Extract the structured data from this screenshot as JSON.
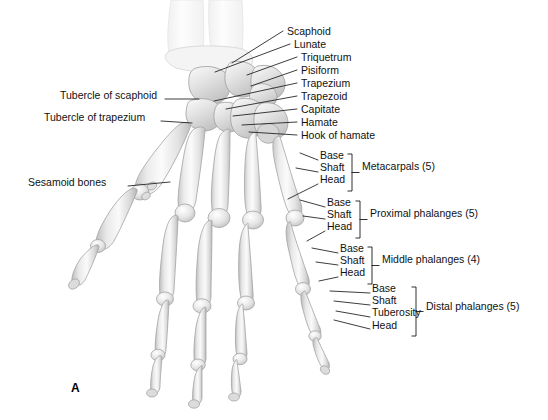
{
  "figure": {
    "panel_label": "A"
  },
  "carpal_labels": [
    {
      "text": "Scaphoid",
      "x": 287,
      "y": 31,
      "tip_x": 232,
      "tip_y": 63
    },
    {
      "text": "Lunate",
      "x": 294,
      "y": 44,
      "tip_x": 215,
      "tip_y": 72
    },
    {
      "text": "Triquetrum",
      "x": 301,
      "y": 57,
      "tip_x": 247,
      "tip_y": 75
    },
    {
      "text": "Pisiform",
      "x": 301,
      "y": 70,
      "tip_x": 251,
      "tip_y": 86
    },
    {
      "text": "Trapezium",
      "x": 301,
      "y": 83,
      "tip_x": 214,
      "tip_y": 101
    },
    {
      "text": "Trapezoid",
      "x": 301,
      "y": 96,
      "tip_x": 226,
      "tip_y": 109
    },
    {
      "text": "Capitate",
      "x": 301,
      "y": 109,
      "tip_x": 233,
      "tip_y": 116
    },
    {
      "text": "Hamate",
      "x": 301,
      "y": 122,
      "tip_x": 242,
      "tip_y": 125
    },
    {
      "text": "Hook of hamate",
      "x": 301,
      "y": 135,
      "tip_x": 249,
      "tip_y": 132
    }
  ],
  "left_labels": [
    {
      "text": "Tubercle of scaphoid",
      "x": 60,
      "y": 95,
      "line_x1": 165,
      "line_y1": 99,
      "line_x2": 199,
      "line_y2": 99
    },
    {
      "text": "Tubercle of trapezium",
      "x": 44,
      "y": 117,
      "line_x1": 161,
      "line_y1": 121,
      "line_x2": 192,
      "line_y2": 123
    },
    {
      "text": "Sesamoid bones",
      "x": 28,
      "y": 182,
      "line_x1": 128,
      "line_y1": 186,
      "line_x2": 170,
      "line_y2": 182
    }
  ],
  "groups": [
    {
      "name": "Metacarpals (5)",
      "parts": [
        "Base",
        "Shaft",
        "Head"
      ],
      "stack_x": 320,
      "stack_y": 155,
      "bracket_x": 352,
      "bracket_top": 154,
      "bracket_bottom": 191,
      "label_x": 362,
      "label_y": 167,
      "leaders": [
        {
          "x1": 318,
          "y1": 160,
          "x2": 300,
          "y2": 153
        },
        {
          "x1": 318,
          "y1": 172,
          "x2": 296,
          "y2": 168
        },
        {
          "x1": 318,
          "y1": 184,
          "x2": 288,
          "y2": 199
        }
      ]
    },
    {
      "name": "Proximal phalanges (5)",
      "parts": [
        "Base",
        "Shaft",
        "Head"
      ],
      "stack_x": 327,
      "stack_y": 202,
      "bracket_x": 360,
      "bracket_top": 201,
      "bracket_bottom": 238,
      "label_x": 370,
      "label_y": 214,
      "leaders": [
        {
          "x1": 325,
          "y1": 207,
          "x2": 300,
          "y2": 200
        },
        {
          "x1": 325,
          "y1": 219,
          "x2": 303,
          "y2": 216
        },
        {
          "x1": 325,
          "y1": 231,
          "x2": 307,
          "y2": 241
        }
      ]
    },
    {
      "name": "Middle phalanges (4)",
      "parts": [
        "Base",
        "Shaft",
        "Head"
      ],
      "stack_x": 340,
      "stack_y": 248,
      "bracket_x": 372,
      "bracket_top": 247,
      "bracket_bottom": 284,
      "label_x": 382,
      "label_y": 260,
      "leaders": [
        {
          "x1": 338,
          "y1": 253,
          "x2": 312,
          "y2": 248
        },
        {
          "x1": 338,
          "y1": 265,
          "x2": 316,
          "y2": 262
        },
        {
          "x1": 338,
          "y1": 277,
          "x2": 319,
          "y2": 281
        }
      ]
    },
    {
      "name": "Distal phalanges (5)",
      "parts": [
        "Base",
        "Shaft",
        "Tuberosity",
        "Head"
      ],
      "stack_x": 372,
      "stack_y": 288,
      "bracket_x": 416,
      "bracket_top": 287,
      "bracket_bottom": 336,
      "label_x": 426,
      "label_y": 307,
      "leaders": [
        {
          "x1": 370,
          "y1": 293,
          "x2": 330,
          "y2": 291
        },
        {
          "x1": 370,
          "y1": 305,
          "x2": 334,
          "y2": 301
        },
        {
          "x1": 370,
          "y1": 317,
          "x2": 336,
          "y2": 311
        },
        {
          "x1": 370,
          "y1": 329,
          "x2": 334,
          "y2": 320
        }
      ]
    }
  ],
  "colors": {
    "background": "#ffffff",
    "text": "#111111",
    "leader_line": "#1a1a1a",
    "bone_light": "#f6f6f6",
    "bone_mid": "#dcdcdc",
    "bone_shade": "#bdbdbd",
    "bone_outline": "#9a9a9a",
    "faint_forearm": "#f2f2f2"
  }
}
